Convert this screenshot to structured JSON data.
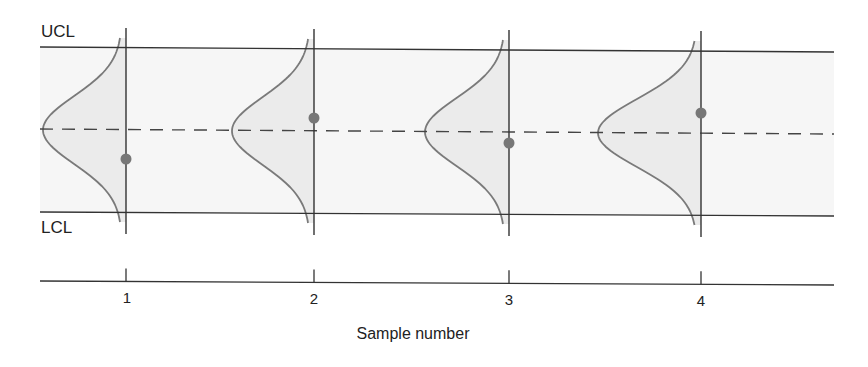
{
  "chart_data": {
    "type": "control_chart",
    "title": "",
    "xlabel": "Sample number",
    "ylabel": "",
    "control_limits": {
      "upper_label": "UCL",
      "lower_label": "LCL",
      "center_line": "dashed"
    },
    "categories": [
      "1",
      "2",
      "3",
      "4"
    ],
    "series": [
      {
        "name": "sample means",
        "values": [
          -0.35,
          0.16,
          -0.13,
          0.26
        ],
        "units": "relative position between center line (0) and limits (UCL=+1, LCL=-1)"
      }
    ],
    "distribution_curves": "normal distribution drawn to the left of each sample line",
    "ylim": [
      -1,
      1
    ]
  },
  "labels": {
    "ucl": "UCL",
    "lcl": "LCL",
    "axis_title": "Sample number",
    "ticks": [
      "1",
      "2",
      "3",
      "4"
    ]
  },
  "colors": {
    "band_fill": "#f6f6f6",
    "bell_fill": "#ebebeb",
    "line": "#333333",
    "curve": "#7a7a7a",
    "dot": "#777777"
  },
  "geometry": {
    "samples": [
      {
        "x": 126,
        "tip": 43,
        "center": 130,
        "dot": 159
      },
      {
        "x": 314,
        "tip": 232,
        "center": 131,
        "dot": 118
      },
      {
        "x": 509,
        "tip": 425,
        "center": 132,
        "dot": 143
      },
      {
        "x": 701,
        "tip": 598,
        "center": 133,
        "dot": 113
      }
    ]
  }
}
